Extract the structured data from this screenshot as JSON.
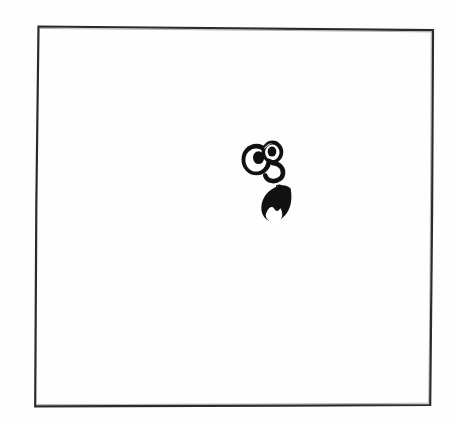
{
  "document": {
    "kind": "scanned-line-art-drawing",
    "medium": "ink on white paper",
    "background_color": "#fefefe",
    "ink_color": "#1a1a1a",
    "width": 454,
    "height": 423,
    "title": "Cartoon face doodle inside hand-drawn frame",
    "visible_text": ""
  },
  "frame": {
    "name": "hand-drawn rectangular border",
    "stroke_color": "#2b2b2b",
    "stroke_width": 2.2,
    "corners": {
      "top_left": [
        38,
        26
      ],
      "top_right": [
        433,
        30
      ],
      "bottom_right": [
        430,
        405
      ],
      "bottom_left": [
        35,
        406
      ]
    }
  },
  "drawing": {
    "name": "cartoon-face",
    "fill_color": "#111111",
    "bounding_box": [
      241,
      139,
      61,
      83
    ],
    "parts": [
      {
        "name": "left-eye",
        "shape": "large ring with filled pupil",
        "center": [
          256,
          159
        ],
        "outer_radius": 15,
        "inner_radius": 10,
        "pupil_center": [
          258,
          158
        ],
        "pupil_radius": 5.5
      },
      {
        "name": "right-eye",
        "shape": "small ring with filled pupil",
        "center": [
          272,
          152
        ],
        "outer_radius": 10.5,
        "inner_radius": 7,
        "pupil_center": [
          272,
          152
        ],
        "pupil_radius": 4.2
      },
      {
        "name": "nose",
        "shape": "curved hook stroke",
        "stroke_width": 4.5
      },
      {
        "name": "mouth",
        "shape": "open teardrop mouth, filled black",
        "bounding_box": [
          261,
          186,
          31,
          36
        ]
      },
      {
        "name": "tooth",
        "shape": "white rounded tooth inside mouth",
        "fill_color": "#ffffff"
      }
    ]
  }
}
